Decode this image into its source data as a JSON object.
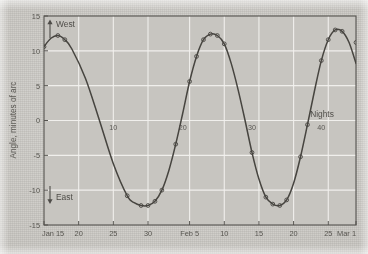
{
  "figure": {
    "kind": "scanned-plot",
    "background_color": "#c9c7c2",
    "ink_color": "#4a4845",
    "grid_color": "#f2f1ee"
  },
  "chart_data": {
    "type": "line",
    "title": "",
    "subtitle": "",
    "xlabel": "",
    "ylabel": "Angle, minutes of arc",
    "xlim_dates": [
      "Jan 15",
      "Mar 1"
    ],
    "ylim": [
      -15,
      15
    ],
    "grid": true,
    "legend_position": "none",
    "x_tick_labels": [
      "Jan 15",
      "20",
      "25",
      "30",
      "Feb 5",
      "10",
      "15",
      "20",
      "25",
      "Mar 1"
    ],
    "x_tick_days": [
      0,
      5,
      10,
      15,
      21,
      26,
      31,
      36,
      41,
      45
    ],
    "y_tick_labels": [
      "15",
      "10",
      "5",
      "0",
      "-5",
      "-10",
      "-15"
    ],
    "y_tick_values": [
      15,
      10,
      5,
      0,
      -5,
      -10,
      -15
    ],
    "inline_axis_labels": {
      "name": "Nights",
      "label_text": "Nights",
      "values": [
        "10",
        "20",
        "30",
        "40"
      ],
      "value_days": [
        10,
        20,
        30,
        40
      ]
    },
    "annotations": [
      {
        "name": "west-arrow-label",
        "text": "West",
        "arrow": "up",
        "at_day": 0.6,
        "at_value": 13.6
      },
      {
        "name": "east-arrow-label",
        "text": "East",
        "arrow": "down",
        "at_day": 0.6,
        "at_value": -10.6
      },
      {
        "name": "nights-label",
        "text": "Nights",
        "at_day": 39.5,
        "at_value": 2.6
      }
    ],
    "series": [
      {
        "name": "elongation",
        "marker": "open-circle",
        "line_style": "solid",
        "x": [
          0,
          1,
          2,
          3,
          4,
          6,
          8,
          10,
          12,
          13,
          14,
          15,
          16,
          17,
          18,
          19,
          20,
          21,
          22,
          23,
          24,
          25,
          26,
          27,
          28,
          29,
          30,
          31,
          32,
          33,
          34,
          35,
          36,
          37,
          38,
          39,
          40,
          41,
          42,
          43,
          44,
          45
        ],
        "y": [
          10.6,
          11.8,
          12.2,
          11.6,
          10.3,
          6.0,
          0.0,
          -6.2,
          -10.8,
          -11.8,
          -12.2,
          -12.2,
          -11.6,
          -10.0,
          -7.2,
          -3.4,
          1.0,
          5.6,
          9.2,
          11.6,
          12.4,
          12.2,
          11.0,
          8.2,
          4.4,
          0.0,
          -4.6,
          -8.4,
          -11.0,
          -12.0,
          -12.2,
          -11.4,
          -9.0,
          -5.2,
          -0.6,
          4.2,
          8.6,
          11.6,
          13.0,
          12.8,
          11.2,
          8.2
        ],
        "marker_points_x": [
          0,
          2,
          3,
          12,
          14,
          15,
          16,
          17,
          19,
          21,
          22,
          23,
          24,
          25,
          26,
          30,
          32,
          33,
          34,
          35,
          37,
          38,
          40,
          41,
          42,
          43,
          45
        ],
        "marker_points_y": [
          10.6,
          12.2,
          11.6,
          -10.8,
          -12.2,
          -12.2,
          -11.6,
          -10.0,
          -3.4,
          5.6,
          9.2,
          11.6,
          12.4,
          12.2,
          11.0,
          -4.6,
          -11.0,
          -12.0,
          -12.2,
          -11.4,
          -5.2,
          -0.6,
          8.6,
          11.6,
          13.0,
          12.8,
          11.2,
          8.2
        ]
      }
    ]
  }
}
